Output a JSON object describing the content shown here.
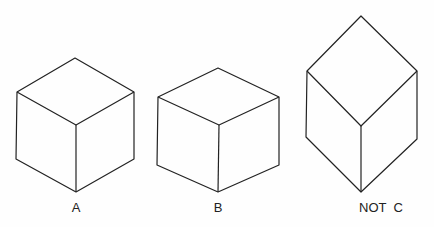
{
  "figure": {
    "labels": {
      "a": "A",
      "b": "B",
      "c": "NOT  C"
    },
    "stroke_color": "#222222",
    "cubes": [
      {
        "id": "A",
        "description": "isometric cube, regular proportions"
      },
      {
        "id": "B",
        "description": "cube with flatter top face"
      },
      {
        "id": "C",
        "description": "elongated shape, not a cube (NOT C)"
      }
    ]
  }
}
